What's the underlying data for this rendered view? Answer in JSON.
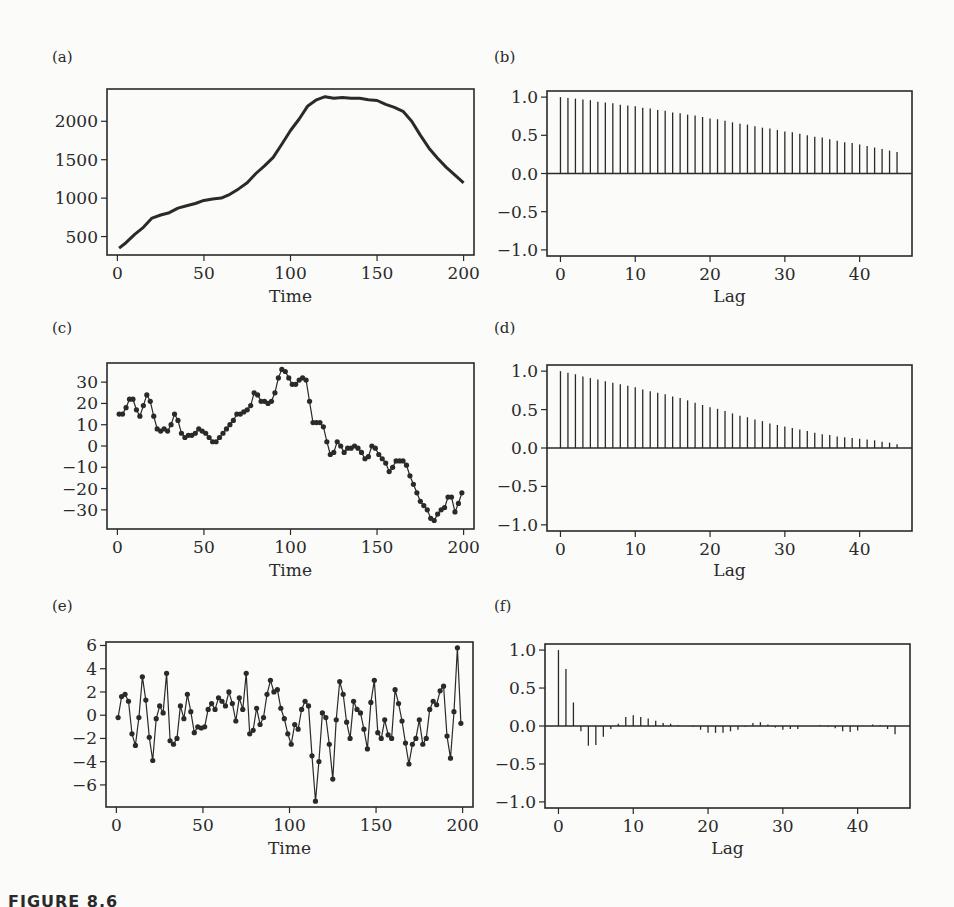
{
  "figure": {
    "caption": "FIGURE 8.6",
    "text_color": "#2a2a2a",
    "background": "#fbfbfa"
  },
  "chart_data": [
    {
      "id": "a",
      "panel_label": "(a)",
      "type": "line",
      "title": "",
      "xlabel": "Time",
      "ylabel": "",
      "xlim": [
        -6,
        206
      ],
      "ylim": [
        260,
        2420
      ],
      "xticks": [
        0,
        50,
        100,
        150,
        200
      ],
      "yticks": [
        500,
        1000,
        1500,
        2000
      ],
      "ytick_labels": [
        "500",
        "1000",
        "1500",
        "2000"
      ],
      "markers": false,
      "grid": false,
      "x": [
        1,
        5,
        10,
        15,
        20,
        25,
        30,
        35,
        40,
        45,
        50,
        55,
        60,
        65,
        70,
        75,
        80,
        85,
        90,
        95,
        100,
        105,
        110,
        115,
        120,
        125,
        130,
        135,
        140,
        145,
        150,
        155,
        160,
        165,
        170,
        175,
        180,
        185,
        190,
        195,
        200
      ],
      "values": [
        350,
        420,
        530,
        620,
        740,
        780,
        810,
        870,
        900,
        930,
        970,
        990,
        1000,
        1050,
        1120,
        1200,
        1320,
        1420,
        1530,
        1700,
        1880,
        2030,
        2200,
        2280,
        2320,
        2300,
        2310,
        2300,
        2300,
        2280,
        2270,
        2220,
        2180,
        2130,
        2000,
        1820,
        1650,
        1520,
        1400,
        1300,
        1200
      ]
    },
    {
      "id": "b",
      "panel_label": "(b)",
      "type": "bar",
      "title": "",
      "xlabel": "Lag",
      "ylabel": "",
      "xlim": [
        -1.8,
        47
      ],
      "ylim": [
        -1.08,
        1.08
      ],
      "xticks": [
        0,
        10,
        20,
        30,
        40
      ],
      "yticks": [
        -1.0,
        -0.5,
        0.0,
        0.5,
        1.0
      ],
      "ytick_labels": [
        "−1.0",
        "−0.5",
        "0.0",
        "0.5",
        "1.0"
      ],
      "grid": false,
      "categories": [
        0,
        1,
        2,
        3,
        4,
        5,
        6,
        7,
        8,
        9,
        10,
        11,
        12,
        13,
        14,
        15,
        16,
        17,
        18,
        19,
        20,
        21,
        22,
        23,
        24,
        25,
        26,
        27,
        28,
        29,
        30,
        31,
        32,
        33,
        34,
        35,
        36,
        37,
        38,
        39,
        40,
        41,
        42,
        43,
        44,
        45
      ],
      "values": [
        1.0,
        0.99,
        0.98,
        0.97,
        0.96,
        0.94,
        0.93,
        0.92,
        0.9,
        0.89,
        0.88,
        0.86,
        0.85,
        0.83,
        0.82,
        0.8,
        0.79,
        0.77,
        0.76,
        0.74,
        0.72,
        0.71,
        0.69,
        0.67,
        0.65,
        0.64,
        0.62,
        0.6,
        0.59,
        0.57,
        0.55,
        0.54,
        0.52,
        0.5,
        0.48,
        0.47,
        0.45,
        0.43,
        0.41,
        0.4,
        0.38,
        0.36,
        0.34,
        0.32,
        0.3,
        0.28
      ]
    },
    {
      "id": "c",
      "panel_label": "(c)",
      "type": "line",
      "title": "",
      "xlabel": "Time",
      "ylabel": "",
      "xlim": [
        -6,
        206
      ],
      "ylim": [
        -39,
        39
      ],
      "xticks": [
        0,
        50,
        100,
        150,
        200
      ],
      "yticks": [
        -30,
        -20,
        -10,
        0,
        10,
        20,
        30
      ],
      "ytick_labels": [
        "−30",
        "−20",
        "−10",
        "0",
        "10",
        "20",
        "30"
      ],
      "markers": true,
      "grid": false,
      "x": [
        1,
        3,
        5,
        7,
        9,
        11,
        13,
        15,
        17,
        19,
        21,
        23,
        25,
        27,
        29,
        31,
        33,
        35,
        37,
        39,
        41,
        43,
        45,
        47,
        49,
        51,
        53,
        55,
        57,
        59,
        61,
        63,
        65,
        67,
        69,
        71,
        73,
        75,
        77,
        79,
        81,
        83,
        85,
        87,
        89,
        91,
        93,
        95,
        97,
        99,
        101,
        103,
        105,
        107,
        109,
        111,
        113,
        115,
        117,
        119,
        121,
        123,
        125,
        127,
        129,
        131,
        133,
        135,
        137,
        139,
        141,
        143,
        145,
        147,
        149,
        151,
        153,
        155,
        157,
        159,
        161,
        163,
        165,
        167,
        169,
        171,
        173,
        175,
        177,
        179,
        181,
        183,
        185,
        187,
        189,
        191,
        193,
        195,
        197,
        199
      ],
      "values": [
        15,
        15,
        18,
        22,
        22,
        17,
        14,
        19,
        24,
        21,
        14,
        8,
        7,
        8,
        7,
        10,
        15,
        12,
        6,
        4,
        5,
        5,
        6,
        8,
        7,
        6,
        4,
        2,
        2,
        4,
        6,
        8,
        10,
        12,
        15,
        15,
        16,
        17,
        19,
        25,
        24,
        21,
        21,
        20,
        21,
        25,
        32,
        36,
        35,
        32,
        29,
        29,
        31,
        32,
        31,
        21,
        11,
        11,
        11,
        9,
        2,
        -4,
        -3,
        2,
        0,
        -3,
        -1,
        -1,
        0,
        -1,
        -3,
        -6,
        -5,
        0,
        -1,
        -4,
        -6,
        -8,
        -12,
        -10,
        -7,
        -7,
        -7,
        -9,
        -14,
        -18,
        -22,
        -26,
        -28,
        -30,
        -34,
        -35,
        -32,
        -30,
        -29,
        -24,
        -24,
        -31,
        -27,
        -22,
        -25,
        -27
      ],
      "note": "series approximated from plot; extends through x=199"
    },
    {
      "id": "d",
      "panel_label": "(d)",
      "type": "bar",
      "title": "",
      "xlabel": "Lag",
      "ylabel": "",
      "xlim": [
        -1.8,
        47
      ],
      "ylim": [
        -1.08,
        1.08
      ],
      "xticks": [
        0,
        10,
        20,
        30,
        40
      ],
      "yticks": [
        -1.0,
        -0.5,
        0.0,
        0.5,
        1.0
      ],
      "ytick_labels": [
        "−1.0",
        "−0.5",
        "0.0",
        "0.5",
        "1.0"
      ],
      "grid": false,
      "categories": [
        0,
        1,
        2,
        3,
        4,
        5,
        6,
        7,
        8,
        9,
        10,
        11,
        12,
        13,
        14,
        15,
        16,
        17,
        18,
        19,
        20,
        21,
        22,
        23,
        24,
        25,
        26,
        27,
        28,
        29,
        30,
        31,
        32,
        33,
        34,
        35,
        36,
        37,
        38,
        39,
        40,
        41,
        42,
        43,
        44,
        45
      ],
      "values": [
        1.0,
        0.98,
        0.96,
        0.93,
        0.91,
        0.89,
        0.87,
        0.85,
        0.83,
        0.81,
        0.79,
        0.76,
        0.74,
        0.72,
        0.7,
        0.67,
        0.65,
        0.62,
        0.59,
        0.56,
        0.53,
        0.51,
        0.48,
        0.45,
        0.42,
        0.4,
        0.37,
        0.35,
        0.32,
        0.3,
        0.28,
        0.26,
        0.24,
        0.22,
        0.2,
        0.18,
        0.17,
        0.15,
        0.14,
        0.13,
        0.12,
        0.11,
        0.1,
        0.08,
        0.07,
        0.05
      ]
    },
    {
      "id": "e",
      "panel_label": "(e)",
      "type": "line",
      "title": "",
      "xlabel": "Time",
      "ylabel": "",
      "xlim": [
        -6,
        206
      ],
      "ylim": [
        -7.9,
        6.3
      ],
      "xticks": [
        0,
        50,
        100,
        150,
        200
      ],
      "yticks": [
        -6,
        -4,
        -2,
        0,
        2,
        4,
        6
      ],
      "ytick_labels": [
        "−6",
        "−4",
        "−2",
        "0",
        "2",
        "4",
        "6"
      ],
      "markers": true,
      "grid": false,
      "x": [
        1,
        3,
        5,
        7,
        9,
        11,
        13,
        15,
        17,
        19,
        21,
        23,
        25,
        27,
        29,
        31,
        33,
        35,
        37,
        39,
        41,
        43,
        45,
        47,
        49,
        51,
        53,
        55,
        57,
        59,
        61,
        63,
        65,
        67,
        69,
        71,
        73,
        75,
        77,
        79,
        81,
        83,
        85,
        87,
        89,
        91,
        93,
        95,
        97,
        99,
        101,
        103,
        105,
        107,
        109,
        111,
        113,
        115,
        117,
        119,
        121,
        123,
        125,
        127,
        129,
        131,
        133,
        135,
        137,
        139,
        141,
        143,
        145,
        147,
        149,
        151,
        153,
        155,
        157,
        159,
        161,
        163,
        165,
        167,
        169,
        171,
        173,
        175,
        177,
        179,
        181,
        183,
        185,
        187,
        189,
        191,
        193,
        195,
        197,
        199
      ],
      "values": [
        -0.2,
        1.6,
        1.8,
        1.2,
        -1.6,
        -2.6,
        -0.2,
        3.3,
        1.3,
        -1.9,
        -3.9,
        -0.3,
        0.8,
        0.2,
        3.6,
        -2.2,
        -2.5,
        -2.0,
        0.8,
        -0.3,
        1.8,
        0.3,
        -1.5,
        -1.0,
        -1.1,
        -1.0,
        0.5,
        1.0,
        0.5,
        1.5,
        1.2,
        0.8,
        2.0,
        1.0,
        -0.5,
        1.5,
        0.5,
        3.6,
        -1.6,
        -1.3,
        0.6,
        -0.8,
        -0.2,
        1.8,
        3.0,
        2.0,
        2.2,
        0.6,
        -0.3,
        -1.6,
        -2.5,
        -0.8,
        -1.2,
        0.5,
        1.2,
        0.8,
        -3.5,
        -7.4,
        -4.0,
        0.2,
        -0.2,
        -2.5,
        -5.5,
        -0.4,
        2.9,
        1.8,
        -0.6,
        -2.0,
        1.2,
        0.5,
        0.2,
        -1.2,
        -2.9,
        1.1,
        3.0,
        -1.5,
        -2.0,
        -0.4,
        -1.7,
        -2.0,
        2.2,
        1.0,
        -0.5,
        -2.4,
        -4.2,
        -2.5,
        -2.0,
        -0.4,
        -2.5,
        -2.0,
        0.5,
        1.2,
        0.9,
        2.1,
        2.5,
        -1.8,
        -3.7,
        0.3,
        5.8,
        -0.7
      ]
    },
    {
      "id": "f",
      "panel_label": "(f)",
      "type": "bar",
      "title": "",
      "xlabel": "Lag",
      "ylabel": "",
      "xlim": [
        -1.8,
        47
      ],
      "ylim": [
        -1.08,
        1.08
      ],
      "xticks": [
        0,
        10,
        20,
        30,
        40
      ],
      "yticks": [
        -1.0,
        -0.5,
        0.0,
        0.5,
        1.0
      ],
      "ytick_labels": [
        "−1.0",
        "−0.5",
        "0.0",
        "0.5",
        "1.0"
      ],
      "grid": false,
      "categories": [
        0,
        1,
        2,
        3,
        4,
        5,
        6,
        7,
        8,
        9,
        10,
        11,
        12,
        13,
        14,
        15,
        16,
        17,
        18,
        19,
        20,
        21,
        22,
        23,
        24,
        25,
        26,
        27,
        28,
        29,
        30,
        31,
        32,
        33,
        34,
        35,
        36,
        37,
        38,
        39,
        40,
        41,
        42,
        43,
        44,
        45
      ],
      "values": [
        1.0,
        0.75,
        0.31,
        -0.07,
        -0.26,
        -0.25,
        -0.14,
        -0.04,
        0.03,
        0.12,
        0.14,
        0.12,
        0.1,
        0.07,
        0.04,
        0.03,
        0.01,
        0.0,
        -0.01,
        -0.05,
        -0.09,
        -0.09,
        -0.09,
        -0.07,
        -0.05,
        -0.01,
        0.04,
        0.05,
        0.02,
        -0.02,
        -0.05,
        -0.04,
        -0.04,
        0.0,
        0.0,
        0.01,
        -0.01,
        -0.03,
        -0.07,
        -0.08,
        -0.06,
        0.0,
        0.02,
        0.01,
        -0.04,
        -0.11
      ]
    }
  ],
  "layout": {
    "panels": [
      {
        "id": "a",
        "label_pos": [
          14,
          56
        ],
        "frame": [
          107,
          89,
          474,
          255
        ],
        "xlabel_y": 302
      },
      {
        "id": "b",
        "label_pos": [
          496,
          56
        ],
        "frame": [
          547,
          91,
          912,
          256
        ],
        "xlabel_y": 302
      },
      {
        "id": "c",
        "label_pos": [
          14,
          327
        ],
        "frame": [
          107,
          363,
          474,
          529
        ],
        "xlabel_y": 576
      },
      {
        "id": "d",
        "label_pos": [
          496,
          327
        ],
        "frame": [
          547,
          365,
          912,
          531
        ],
        "xlabel_y": 576
      },
      {
        "id": "e",
        "label_pos": [
          14,
          601
        ],
        "frame": [
          106,
          642,
          473,
          807
        ],
        "xlabel_y": 854
      },
      {
        "id": "f",
        "label_pos": [
          496,
          601
        ],
        "frame": [
          545,
          644,
          910,
          808
        ],
        "xlabel_y": 854
      }
    ]
  }
}
